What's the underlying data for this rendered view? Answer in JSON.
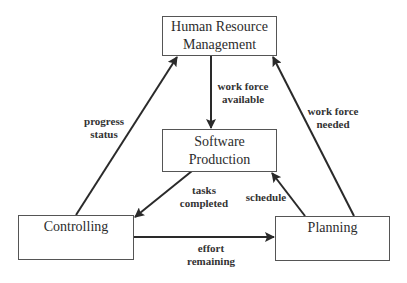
{
  "nodes": {
    "hrm": {
      "line1": "Human Resource",
      "line2": "Management"
    },
    "software": {
      "line1": "Software",
      "line2": "Production"
    },
    "controlling": {
      "label": "Controlling"
    },
    "planning": {
      "label": "Planning"
    }
  },
  "edges": {
    "work_force_available": {
      "line1": "work force",
      "line2": "available",
      "from": "Human Resource Management",
      "to": "Software Production"
    },
    "progress_status": {
      "line1": "progress",
      "line2": "status",
      "from": "Controlling",
      "to": "Human Resource Management"
    },
    "work_force_needed": {
      "line1": "work force",
      "line2": "needed",
      "from": "Planning",
      "to": "Human Resource Management"
    },
    "tasks_completed": {
      "line1": "tasks",
      "line2": "completed",
      "from": "Software Production",
      "to": "Controlling"
    },
    "schedule": {
      "label": "schedule",
      "from": "Planning",
      "to": "Software Production"
    },
    "effort_remaining": {
      "line1": "effort",
      "line2": "remaining",
      "from": "Controlling",
      "to": "Planning"
    }
  },
  "colors": {
    "line": "#2a2a2a",
    "box_border": "#555555",
    "background": "#ffffff"
  }
}
